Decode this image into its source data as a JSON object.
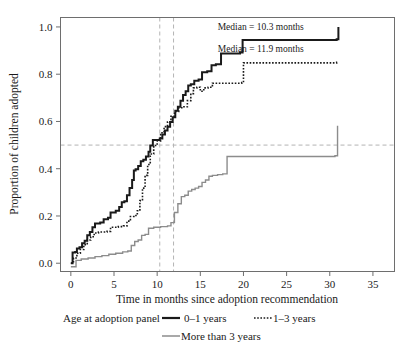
{
  "chart_data": {
    "type": "line",
    "title": "",
    "xlabel": "Time in months since adoption recommendation",
    "ylabel": "Proportion of children adopted",
    "xlim": [
      -1.2,
      37.5
    ],
    "ylim": [
      -0.035,
      1.04
    ],
    "xticks": [
      0,
      5,
      10,
      15,
      20,
      25,
      30,
      35
    ],
    "xtick_labels": [
      "0",
      "5",
      "10",
      "15",
      "20",
      "25",
      "30",
      "35"
    ],
    "yticks": [
      0.0,
      0.2,
      0.4,
      0.6,
      0.8,
      1.0
    ],
    "ytick_labels": [
      "0.0",
      "0.2",
      "0.4",
      "0.6",
      "0.8",
      "1.0"
    ],
    "grid": false,
    "legend_position": "below-axes",
    "legend_title": "Age at adoption panel",
    "reference_lines": [
      {
        "name": "median-0-1-vline",
        "orientation": "vertical",
        "value": 10.3,
        "style": "dashed",
        "color": "#b4b4b4"
      },
      {
        "name": "median-1-3-vline",
        "orientation": "vertical",
        "value": 11.9,
        "style": "dashed",
        "color": "#b4b4b4"
      },
      {
        "name": "half-proportion-hline",
        "orientation": "horizontal",
        "value": 0.5,
        "style": "dashed",
        "color": "#b4b4b4"
      }
    ],
    "annotations": [
      {
        "name": "median-0-1-annotation",
        "text": "Median = 10.3 months",
        "x": 22.0,
        "y": 0.985
      },
      {
        "name": "median-1-3-annotation",
        "text": "Median = 11.9 months",
        "x": 22.0,
        "y": 0.895
      }
    ],
    "series": [
      {
        "name": "0–1 years",
        "style": "solid",
        "color": "#1a1a1a",
        "width": 2.0,
        "points": [
          [
            0.0,
            0.0
          ],
          [
            0.2,
            0.045
          ],
          [
            0.5,
            0.048
          ],
          [
            0.7,
            0.062
          ],
          [
            1.0,
            0.068
          ],
          [
            1.3,
            0.085
          ],
          [
            1.6,
            0.095
          ],
          [
            1.9,
            0.118
          ],
          [
            2.2,
            0.132
          ],
          [
            2.5,
            0.152
          ],
          [
            2.8,
            0.168
          ],
          [
            3.4,
            0.172
          ],
          [
            3.8,
            0.186
          ],
          [
            4.3,
            0.192
          ],
          [
            4.6,
            0.215
          ],
          [
            5.2,
            0.222
          ],
          [
            5.6,
            0.238
          ],
          [
            5.9,
            0.258
          ],
          [
            6.2,
            0.262
          ],
          [
            6.5,
            0.288
          ],
          [
            6.8,
            0.318
          ],
          [
            7.1,
            0.352
          ],
          [
            7.3,
            0.392
          ],
          [
            7.5,
            0.398
          ],
          [
            7.8,
            0.412
          ],
          [
            8.1,
            0.432
          ],
          [
            8.4,
            0.438
          ],
          [
            8.7,
            0.452
          ],
          [
            9.0,
            0.472
          ],
          [
            9.2,
            0.498
          ],
          [
            9.5,
            0.522
          ],
          [
            10.3,
            0.528
          ],
          [
            10.6,
            0.545
          ],
          [
            10.9,
            0.562
          ],
          [
            11.2,
            0.578
          ],
          [
            11.5,
            0.598
          ],
          [
            11.8,
            0.618
          ],
          [
            12.1,
            0.645
          ],
          [
            12.4,
            0.662
          ],
          [
            12.7,
            0.688
          ],
          [
            13.0,
            0.712
          ],
          [
            13.3,
            0.728
          ],
          [
            13.6,
            0.752
          ],
          [
            13.9,
            0.758
          ],
          [
            14.3,
            0.772
          ],
          [
            14.8,
            0.778
          ],
          [
            15.2,
            0.808
          ],
          [
            15.8,
            0.812
          ],
          [
            16.3,
            0.838
          ],
          [
            16.8,
            0.842
          ],
          [
            17.4,
            0.888
          ],
          [
            19.6,
            0.892
          ],
          [
            19.9,
            0.945
          ],
          [
            30.8,
            0.948
          ],
          [
            31.0,
            1.0
          ]
        ]
      },
      {
        "name": "1–3 years",
        "style": "dotted",
        "color": "#1a1a1a",
        "width": 1.6,
        "points": [
          [
            0.0,
            0.0
          ],
          [
            0.3,
            0.022
          ],
          [
            0.7,
            0.042
          ],
          [
            1.1,
            0.058
          ],
          [
            1.5,
            0.078
          ],
          [
            1.9,
            0.098
          ],
          [
            2.3,
            0.112
          ],
          [
            2.7,
            0.128
          ],
          [
            3.2,
            0.132
          ],
          [
            4.2,
            0.135
          ],
          [
            4.6,
            0.152
          ],
          [
            5.5,
            0.155
          ],
          [
            6.1,
            0.158
          ],
          [
            6.5,
            0.178
          ],
          [
            6.9,
            0.198
          ],
          [
            7.3,
            0.202
          ],
          [
            7.7,
            0.222
          ],
          [
            8.0,
            0.265
          ],
          [
            8.3,
            0.318
          ],
          [
            8.6,
            0.372
          ],
          [
            8.9,
            0.418
          ],
          [
            9.2,
            0.462
          ],
          [
            9.6,
            0.498
          ],
          [
            10.0,
            0.518
          ],
          [
            10.4,
            0.552
          ],
          [
            10.8,
            0.578
          ],
          [
            11.2,
            0.598
          ],
          [
            11.6,
            0.622
          ],
          [
            12.0,
            0.642
          ],
          [
            12.5,
            0.658
          ],
          [
            13.1,
            0.662
          ],
          [
            13.5,
            0.688
          ],
          [
            13.9,
            0.718
          ],
          [
            14.2,
            0.742
          ],
          [
            14.6,
            0.745
          ],
          [
            15.0,
            0.728
          ],
          [
            15.4,
            0.742
          ],
          [
            15.9,
            0.745
          ],
          [
            16.4,
            0.762
          ],
          [
            19.8,
            0.765
          ],
          [
            20.0,
            0.848
          ],
          [
            30.8,
            0.85
          ],
          [
            31.0,
            0.852
          ]
        ]
      },
      {
        "name": "More than 3 years",
        "style": "solid",
        "color": "#8c8c8c",
        "width": 1.4,
        "points": [
          [
            0.0,
            -0.015
          ],
          [
            0.6,
            0.012
          ],
          [
            1.2,
            0.018
          ],
          [
            2.0,
            0.022
          ],
          [
            2.8,
            0.028
          ],
          [
            3.6,
            0.032
          ],
          [
            4.4,
            0.038
          ],
          [
            5.2,
            0.042
          ],
          [
            6.0,
            0.048
          ],
          [
            6.6,
            0.052
          ],
          [
            7.0,
            0.075
          ],
          [
            7.4,
            0.092
          ],
          [
            7.8,
            0.098
          ],
          [
            8.2,
            0.118
          ],
          [
            8.6,
            0.122
          ],
          [
            9.0,
            0.148
          ],
          [
            9.6,
            0.152
          ],
          [
            10.4,
            0.155
          ],
          [
            11.2,
            0.158
          ],
          [
            11.6,
            0.172
          ],
          [
            12.0,
            0.215
          ],
          [
            12.4,
            0.252
          ],
          [
            12.8,
            0.282
          ],
          [
            13.2,
            0.288
          ],
          [
            13.6,
            0.305
          ],
          [
            14.0,
            0.312
          ],
          [
            14.4,
            0.318
          ],
          [
            14.8,
            0.325
          ],
          [
            15.2,
            0.342
          ],
          [
            15.6,
            0.352
          ],
          [
            16.0,
            0.368
          ],
          [
            16.4,
            0.372
          ],
          [
            17.0,
            0.375
          ],
          [
            17.6,
            0.378
          ],
          [
            18.1,
            0.452
          ],
          [
            30.6,
            0.455
          ],
          [
            30.9,
            0.582
          ]
        ]
      }
    ]
  },
  "legend": {
    "title": "Age at adoption panel",
    "entries": [
      {
        "label": "0–1 years",
        "style": "solid",
        "color": "#1a1a1a"
      },
      {
        "label": "1–3 years",
        "style": "dotted",
        "color": "#1a1a1a"
      },
      {
        "label": "More than 3 years",
        "style": "solid",
        "color": "#8c8c8c"
      }
    ]
  },
  "colors": {
    "axis": "#6e6e6e",
    "frame": "#6e6e6e",
    "reference": "#b4b4b4",
    "series_0_1": "#1a1a1a",
    "series_1_3": "#1a1a1a",
    "series_3plus": "#8c8c8c",
    "text": "#1a1a1a",
    "background": "#ffffff"
  }
}
